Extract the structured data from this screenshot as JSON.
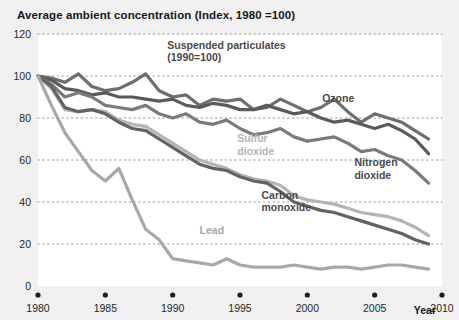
{
  "chart_data": {
    "type": "line",
    "title": "Average ambient concentration (Index, 1980 =100)",
    "xlabel": "Year",
    "ylabel": "",
    "xlim": [
      1980,
      2010
    ],
    "ylim": [
      0,
      120
    ],
    "xticks": [
      "1980",
      "1985",
      "1990",
      "1995",
      "2000",
      "2005",
      "2010"
    ],
    "yticks": [
      "0",
      "20",
      "40",
      "60",
      "80",
      "100",
      "120"
    ],
    "grid": "horizontal-dotted",
    "legend": "inline-labels",
    "x": [
      1980,
      1981,
      1982,
      1983,
      1984,
      1985,
      1986,
      1987,
      1988,
      1989,
      1990,
      1991,
      1992,
      1993,
      1994,
      1995,
      1996,
      1997,
      1998,
      1999,
      2000,
      2001,
      2002,
      2003,
      2004,
      2005,
      2006,
      2007,
      2008,
      2009
    ],
    "series": [
      {
        "name": "Ozone",
        "label": "Ozone",
        "color": "#6e6e6e",
        "label_x": 2001.1,
        "label_y": 87.5,
        "values": [
          100,
          99,
          97,
          101,
          95,
          93,
          94,
          97,
          101,
          93,
          90,
          91,
          86,
          89,
          88,
          89,
          84,
          85,
          89,
          86,
          83,
          85,
          89,
          83,
          78,
          82,
          80,
          78,
          74,
          70
        ]
      },
      {
        "name": "Suspended particulates",
        "label": "Suspended particulates (1990=100)",
        "color": "#5a5a5a",
        "label_x": 1989.6,
        "label_y": 113.0,
        "values": [
          100,
          98,
          94,
          93,
          91,
          92,
          90,
          90,
          89,
          88,
          89,
          86,
          85,
          87,
          86,
          84,
          84,
          86,
          84,
          82,
          83,
          80,
          78,
          79,
          77,
          75,
          77,
          74,
          70,
          63
        ]
      },
      {
        "name": "Nitrogen dioxide",
        "label": "Nitrogen dioxide",
        "color": "#7a7a7a",
        "label_x": 2003.5,
        "label_y": 57.0,
        "values": [
          100,
          96,
          90,
          92,
          90,
          86,
          85,
          84,
          86,
          82,
          80,
          82,
          78,
          77,
          79,
          75,
          72,
          73,
          75,
          71,
          69,
          70,
          71,
          68,
          64,
          65,
          62,
          60,
          55,
          49
        ]
      },
      {
        "name": "Sulfur dioxide",
        "label": "Sulfur dioxide",
        "color": "#b4b4b4",
        "label_x": 1994.8,
        "label_y": 68.5,
        "values": [
          100,
          94,
          84,
          83,
          84,
          83,
          79,
          77,
          76,
          72,
          68,
          64,
          60,
          58,
          56,
          53,
          51,
          50,
          48,
          43,
          41,
          40,
          39,
          37,
          35,
          34,
          33,
          31,
          28,
          24
        ]
      },
      {
        "name": "Carbon monoxide",
        "label": "Carbon monoxide",
        "color": "#636363",
        "label_x": 1996.6,
        "label_y": 41.5,
        "values": [
          100,
          95,
          85,
          83,
          84,
          82,
          78,
          75,
          74,
          70,
          66,
          62,
          58,
          56,
          55,
          52,
          50,
          49,
          45,
          40,
          38,
          36,
          35,
          33,
          31,
          29,
          27,
          25,
          22,
          20
        ]
      },
      {
        "name": "Lead",
        "label": "Lead",
        "color": "#a8a8a8",
        "label_x": 1992.0,
        "label_y": 25.0,
        "values": [
          100,
          86,
          73,
          64,
          55,
          50,
          56,
          41,
          27,
          22,
          13,
          12,
          11,
          10,
          13,
          10,
          9,
          9,
          9,
          10,
          9,
          8,
          9,
          9,
          8,
          9,
          10,
          10,
          9,
          8
        ]
      }
    ]
  }
}
